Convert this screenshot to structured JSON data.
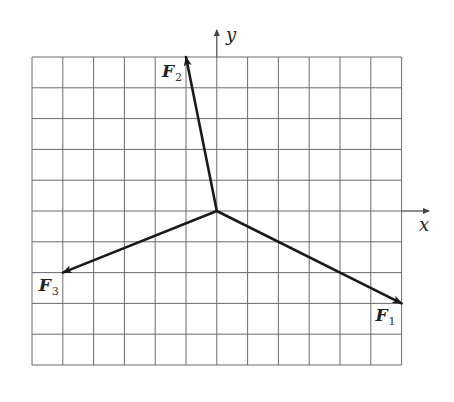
{
  "diagram": {
    "type": "vector-force-diagram",
    "grid": {
      "columns": 12,
      "rows": 10,
      "left": 32,
      "top": 57,
      "cell": 30.8,
      "line_color": "#6b6b6b",
      "origin_col": 6,
      "origin_row": 5
    },
    "axes": {
      "x_label": "x",
      "y_label": "y",
      "color": "#444444"
    },
    "vectors": [
      {
        "name": "F",
        "subscript": "1",
        "dx": 6,
        "dy": -3,
        "label_offset": [
          -26,
          18
        ]
      },
      {
        "name": "F",
        "subscript": "2",
        "dx": -1,
        "dy": 5,
        "label_offset": [
          -24,
          20
        ]
      },
      {
        "name": "F",
        "subscript": "3",
        "dx": -5,
        "dy": -2,
        "label_offset": [
          -24,
          18
        ]
      }
    ],
    "vector_color": "#1a1a1a"
  }
}
